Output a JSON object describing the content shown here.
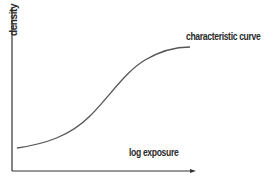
{
  "diagram": {
    "y_axis_label": "density",
    "x_axis_label": "log exposure",
    "curve_label": "characteristic curve",
    "colors": {
      "axis": "#333333",
      "curve": "#555555",
      "text": "#2a2a2a"
    }
  }
}
